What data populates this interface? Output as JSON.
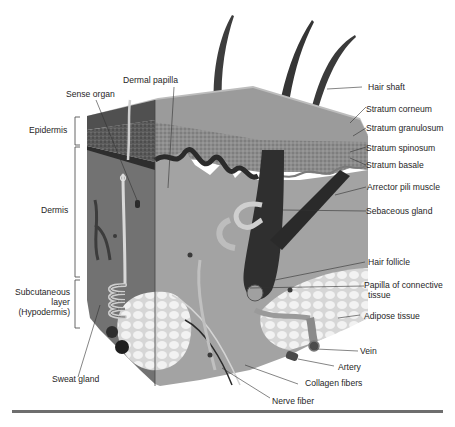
{
  "figure": {
    "layer_labels": [
      {
        "id": "epidermis",
        "text": "Epidermis"
      },
      {
        "id": "dermis",
        "text": "Dermis"
      },
      {
        "id": "subcutaneous",
        "lines": [
          "Subcutaneous",
          "layer",
          "(Hypodermis)"
        ]
      }
    ],
    "top_labels": [
      {
        "id": "sense-organ",
        "text": "Sense organ"
      },
      {
        "id": "dermal-papilla",
        "text": "Dermal papilla"
      }
    ],
    "right_labels": [
      {
        "id": "hair-shaft",
        "text": "Hair shaft"
      },
      {
        "id": "stratum-corneum",
        "text": "Stratum corneum"
      },
      {
        "id": "stratum-granulosum",
        "text": "Stratum granulosum"
      },
      {
        "id": "stratum-spinosum",
        "text": "Stratum spinosum"
      },
      {
        "id": "stratum-basale",
        "text": "Stratum basale"
      },
      {
        "id": "arrector-pili-muscle",
        "text": "Arrector pili muscle"
      },
      {
        "id": "sebaceous-gland",
        "text": "Sebaceous gland"
      },
      {
        "id": "hair-follicle",
        "text": "Hair follicle"
      },
      {
        "id": "papilla-of-connective-tissue",
        "lines": [
          "Papilla of connective",
          "tissue"
        ]
      },
      {
        "id": "adipose-tissue",
        "text": "Adipose tissue"
      },
      {
        "id": "vein",
        "text": "Vein"
      },
      {
        "id": "artery",
        "text": "Artery"
      },
      {
        "id": "collagen-fibers",
        "text": "Collagen fibers"
      },
      {
        "id": "nerve-fiber",
        "text": "Nerve fiber"
      }
    ],
    "bottom_labels": [
      {
        "id": "sweat-gland",
        "text": "Sweat gland"
      }
    ]
  },
  "colors": {
    "background": "#ffffff",
    "skin_top": "#b9b9b9",
    "epidermis_dark": "#4a4a4a",
    "dermis": "#9a9a9a",
    "dermis_left_face": "#6f6f6f",
    "hair": "#3a3a3a",
    "adipose": "#e8e8e8",
    "rule": "#6e6e6e",
    "leader": "#333333"
  }
}
